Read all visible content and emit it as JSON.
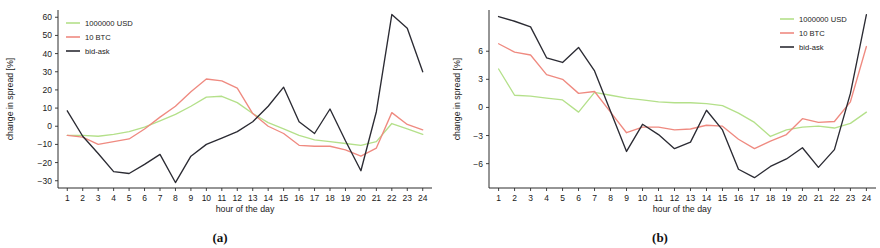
{
  "figure": {
    "panels": [
      {
        "caption": "(a)",
        "xlabel": "hour of the day",
        "ylabel": "change in spread [%]",
        "legend_position": "top-left",
        "yticks": [
          60,
          50,
          40,
          30,
          20,
          10,
          0,
          -10,
          -20,
          -30
        ],
        "ylim": [
          -34,
          64
        ],
        "xticks": [
          1,
          2,
          3,
          4,
          5,
          6,
          7,
          8,
          9,
          10,
          11,
          12,
          13,
          14,
          15,
          16,
          17,
          18,
          19,
          20,
          21,
          22,
          23,
          24
        ]
      },
      {
        "caption": "(b)",
        "xlabel": "hour of the day",
        "ylabel": "change in spread [%]",
        "legend_position": "top-right",
        "yticks": [
          6,
          3,
          0,
          -3,
          -6
        ],
        "ylim": [
          -8.6,
          10.4
        ],
        "xticks": [
          1,
          2,
          3,
          4,
          5,
          6,
          7,
          8,
          9,
          10,
          11,
          12,
          13,
          14,
          15,
          16,
          17,
          18,
          19,
          20,
          21,
          22,
          23,
          24
        ]
      }
    ],
    "colors": {
      "usd": "#b4e08a",
      "btc": "#ef8a80",
      "bidask": "#2b2b33",
      "axis": "#2c2c2c",
      "text": "#1a1a1a"
    }
  },
  "chart_data": [
    {
      "type": "line",
      "title": "(a)",
      "xlabel": "hour of the day",
      "ylabel": "change in spread [%]",
      "x": [
        1,
        2,
        3,
        4,
        5,
        6,
        7,
        8,
        9,
        10,
        11,
        12,
        13,
        14,
        15,
        16,
        17,
        18,
        19,
        20,
        21,
        22,
        23,
        24
      ],
      "xlim": [
        0.4,
        24.6
      ],
      "ylim": [
        -34,
        64
      ],
      "yticks": [
        -30,
        -20,
        -10,
        0,
        10,
        20,
        30,
        40,
        50,
        60
      ],
      "grid": false,
      "legend": [
        "1000000 USD",
        "10 BTC",
        "bid-ask"
      ],
      "legend_position": "top-left",
      "series": [
        {
          "name": "1000000 USD",
          "color": "#b4e08a",
          "values": [
            -5.0,
            -5.0,
            -5.5,
            -4.5,
            -3.0,
            -0.5,
            3.0,
            6.5,
            11.0,
            16.0,
            16.5,
            13.0,
            7.0,
            2.0,
            -1.5,
            -5.0,
            -7.5,
            -8.5,
            -9.5,
            -10.5,
            -8.5,
            1.5,
            -1.5,
            -4.5
          ]
        },
        {
          "name": "10 BTC",
          "color": "#ef8a80",
          "values": [
            -5.0,
            -6.0,
            -10.0,
            -8.5,
            -7.0,
            -1.5,
            5.0,
            11.0,
            19.0,
            26.0,
            25.0,
            21.0,
            7.0,
            0.0,
            -4.0,
            -10.5,
            -11.0,
            -11.0,
            -13.0,
            -16.5,
            -12.0,
            7.5,
            1.0,
            -2.0
          ]
        },
        {
          "name": "bid-ask",
          "color": "#2b2b33",
          "values": [
            8.5,
            -5.5,
            -15.0,
            -25.0,
            -26.0,
            -21.0,
            -15.5,
            -31.0,
            -16.5,
            -10.0,
            -6.5,
            -3.0,
            2.5,
            11.0,
            21.5,
            2.5,
            -4.0,
            9.5,
            -8.0,
            -24.5,
            8.0,
            61.5,
            54.0,
            30.0
          ]
        }
      ]
    },
    {
      "type": "line",
      "title": "(b)",
      "xlabel": "hour of the day",
      "ylabel": "change in spread [%]",
      "x": [
        1,
        2,
        3,
        4,
        5,
        6,
        7,
        8,
        9,
        10,
        11,
        12,
        13,
        14,
        15,
        16,
        17,
        18,
        19,
        20,
        21,
        22,
        23,
        24
      ],
      "xlim": [
        0.4,
        24.6
      ],
      "ylim": [
        -8.6,
        10.4
      ],
      "yticks": [
        -6,
        -3,
        0,
        3,
        6
      ],
      "grid": false,
      "legend": [
        "1000000 USD",
        "10 BTC",
        "bid-ask"
      ],
      "legend_position": "top-right",
      "series": [
        {
          "name": "1000000 USD",
          "color": "#b4e08a",
          "values": [
            4.1,
            1.3,
            1.2,
            1.0,
            0.8,
            -0.5,
            1.6,
            1.3,
            1.0,
            0.8,
            0.6,
            0.5,
            0.5,
            0.4,
            0.2,
            -0.6,
            -1.6,
            -3.1,
            -2.4,
            -2.1,
            -2.0,
            -2.2,
            -1.7,
            -0.5,
            4.1
          ]
        },
        {
          "name": "10 BTC",
          "color": "#ef8a80",
          "values": [
            6.8,
            5.9,
            5.6,
            3.5,
            3.0,
            1.5,
            1.7,
            -0.5,
            -2.7,
            -2.1,
            -2.1,
            -2.4,
            -2.3,
            -1.9,
            -2.0,
            -3.4,
            -4.4,
            -3.6,
            -2.9,
            -1.2,
            -1.6,
            -1.5,
            0.6,
            6.5
          ]
        },
        {
          "name": "bid-ask",
          "color": "#2b2b33",
          "values": [
            9.7,
            9.2,
            8.6,
            5.3,
            4.8,
            6.4,
            3.9,
            -0.4,
            -4.7,
            -1.8,
            -2.9,
            -4.4,
            -3.7,
            -0.3,
            -2.4,
            -6.6,
            -7.5,
            -6.3,
            -5.5,
            -4.3,
            -6.4,
            -4.5,
            1.5,
            9.9
          ]
        }
      ]
    }
  ]
}
